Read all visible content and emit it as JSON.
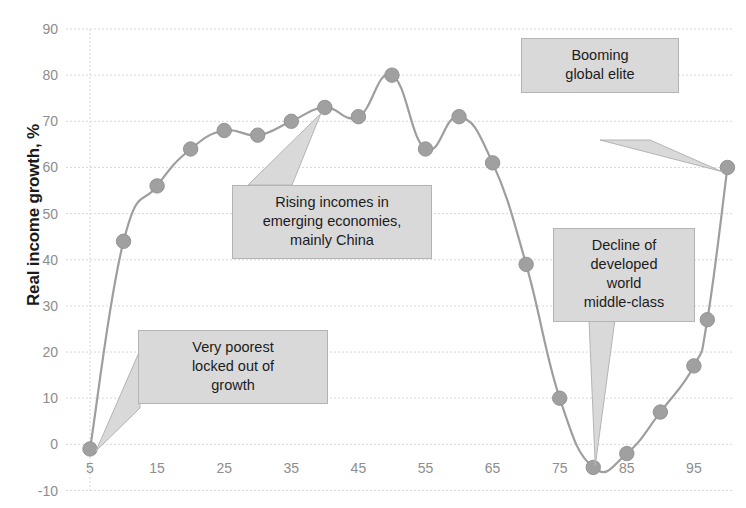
{
  "chart_data": {
    "type": "line",
    "title": "",
    "subtitle": "",
    "xlabel": "",
    "ylabel": "Real income growth, %",
    "x": [
      5,
      10,
      15,
      20,
      25,
      30,
      35,
      40,
      45,
      50,
      55,
      60,
      65,
      70,
      75,
      80,
      85,
      90,
      95,
      97,
      100
    ],
    "values": [
      -1,
      44,
      56,
      64,
      68,
      67,
      70,
      73,
      71,
      80,
      64,
      71,
      61,
      39,
      10,
      -5,
      -2,
      7,
      17,
      27,
      60
    ],
    "series": [
      {
        "name": "Real income growth",
        "values": [
          -1,
          44,
          56,
          64,
          68,
          67,
          70,
          73,
          71,
          80,
          64,
          71,
          61,
          39,
          10,
          -5,
          -2,
          7,
          17,
          27,
          60
        ]
      }
    ],
    "xlim": [
      0,
      103
    ],
    "ylim": [
      -10,
      90
    ],
    "xticks": [
      "5",
      "15",
      "25",
      "35",
      "45",
      "55",
      "65",
      "75",
      "85",
      "95"
    ],
    "xtick_values": [
      5,
      15,
      25,
      35,
      45,
      55,
      65,
      75,
      85,
      95
    ],
    "yticks": [
      "-10",
      "0",
      "10",
      "20",
      "30",
      "40",
      "50",
      "60",
      "70",
      "80",
      "90"
    ],
    "ytick_values": [
      -10,
      0,
      10,
      20,
      30,
      40,
      50,
      60,
      70,
      80,
      90
    ],
    "grid": "horizontal",
    "legend": "none",
    "marker": "circle",
    "series_color": "#9e9e9e",
    "marker_color": "#a0a0a0",
    "grid_color": "#d7d7d7",
    "tick_text_color": "#8d8d8d",
    "axis_label_color": "#1a1a1a",
    "callout_fill": "#d9d9d9",
    "callout_border": "#b4b4b4"
  },
  "annotations": {
    "poorest": {
      "name": "very-poorest",
      "lines": [
        "Very poorest",
        "locked out of",
        "growth"
      ],
      "points_to_x": 5,
      "points_to_y": -1
    },
    "rising": {
      "name": "rising-incomes",
      "lines": [
        "Rising incomes in",
        "emerging economies,",
        "mainly China"
      ],
      "points_to_x": 40,
      "points_to_y": 73
    },
    "booming": {
      "name": "booming-global-elite",
      "lines": [
        "Booming",
        "global elite"
      ],
      "points_to_x": 100,
      "points_to_y": 60
    },
    "decline": {
      "name": "decline-of-middle-class",
      "lines": [
        "Decline of",
        "developed",
        "world",
        "middle-class"
      ],
      "points_to_x": 80,
      "points_to_y": -5
    }
  }
}
